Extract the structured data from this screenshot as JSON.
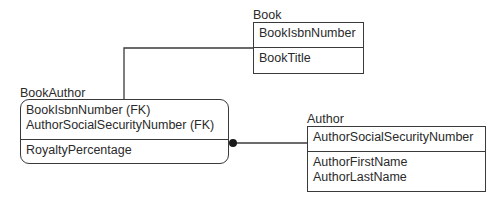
{
  "diagram": {
    "type": "IDEF1X entity-relationship diagram",
    "colors": {
      "line": "#3a3a3a",
      "text": "#2a2a2a",
      "background": "#ffffff"
    },
    "entities": {
      "book": {
        "name": "Book",
        "keys": [
          "BookIsbnNumber"
        ],
        "attributes": [
          "BookTitle"
        ]
      },
      "book_author": {
        "name": "BookAuthor",
        "keys": [
          "BookIsbnNumber (FK)",
          "AuthorSocialSecurityNumber (FK)"
        ],
        "attributes": [
          "RoyaltyPercentage"
        ]
      },
      "author": {
        "name": "Author",
        "keys": [
          "AuthorSocialSecurityNumber"
        ],
        "attributes": [
          "AuthorFirstName",
          "AuthorLastName"
        ]
      }
    },
    "relationships": [
      {
        "from": "Book",
        "to": "BookAuthor",
        "end_symbol": "filled-dot"
      },
      {
        "from": "Author",
        "to": "BookAuthor",
        "end_symbol": "filled-dot"
      }
    ]
  }
}
